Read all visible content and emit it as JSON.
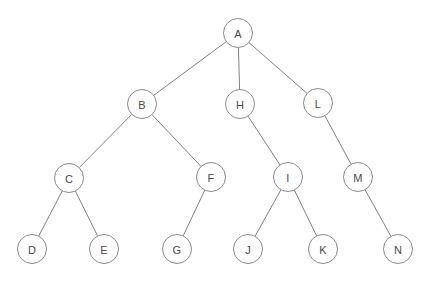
{
  "diagram": {
    "type": "tree",
    "canvas": {
      "width": 433,
      "height": 281,
      "background": "#ffffff"
    },
    "style": {
      "node_fill": "#ffffff",
      "node_stroke": "#8a8a8a",
      "node_radius": 14.5,
      "edge_stroke": "#808080",
      "edge_width": 1,
      "label_color": "#4a4a4a",
      "label_size": 11
    },
    "root": "A",
    "levels": [
      [
        "A"
      ],
      [
        "B",
        "H",
        "L"
      ],
      [
        "C",
        "F",
        "I",
        "M"
      ],
      [
        "D",
        "E",
        "G",
        "J",
        "K",
        "N"
      ]
    ],
    "nodes": [
      {
        "id": "A",
        "label": "A",
        "x": 238,
        "y": 33,
        "level": 0,
        "parent": null
      },
      {
        "id": "B",
        "label": "B",
        "x": 142,
        "y": 104,
        "level": 1,
        "parent": "A"
      },
      {
        "id": "H",
        "label": "H",
        "x": 240,
        "y": 104,
        "level": 1,
        "parent": "A"
      },
      {
        "id": "L",
        "label": "L",
        "x": 318,
        "y": 103,
        "level": 1,
        "parent": "A"
      },
      {
        "id": "C",
        "label": "C",
        "x": 69,
        "y": 178,
        "level": 2,
        "parent": "B"
      },
      {
        "id": "F",
        "label": "F",
        "x": 211,
        "y": 177,
        "level": 2,
        "parent": "B"
      },
      {
        "id": "I",
        "label": "I",
        "x": 288,
        "y": 177,
        "level": 2,
        "parent": "H"
      },
      {
        "id": "M",
        "label": "M",
        "x": 358,
        "y": 177,
        "level": 2,
        "parent": "L"
      },
      {
        "id": "D",
        "label": "D",
        "x": 32,
        "y": 249,
        "level": 3,
        "parent": "C"
      },
      {
        "id": "E",
        "label": "E",
        "x": 104,
        "y": 249,
        "level": 3,
        "parent": "C"
      },
      {
        "id": "G",
        "label": "G",
        "x": 177,
        "y": 249,
        "level": 3,
        "parent": "F"
      },
      {
        "id": "J",
        "label": "J",
        "x": 248,
        "y": 249,
        "level": 3,
        "parent": "I"
      },
      {
        "id": "K",
        "label": "K",
        "x": 323,
        "y": 249,
        "level": 3,
        "parent": "I"
      },
      {
        "id": "N",
        "label": "N",
        "x": 398,
        "y": 249,
        "level": 3,
        "parent": "M"
      }
    ],
    "edges": [
      {
        "from": "A",
        "to": "B"
      },
      {
        "from": "A",
        "to": "H"
      },
      {
        "from": "A",
        "to": "L"
      },
      {
        "from": "B",
        "to": "C"
      },
      {
        "from": "B",
        "to": "F"
      },
      {
        "from": "C",
        "to": "D"
      },
      {
        "from": "C",
        "to": "E"
      },
      {
        "from": "F",
        "to": "G"
      },
      {
        "from": "H",
        "to": "I"
      },
      {
        "from": "I",
        "to": "J"
      },
      {
        "from": "I",
        "to": "K"
      },
      {
        "from": "L",
        "to": "M"
      },
      {
        "from": "M",
        "to": "N"
      }
    ]
  }
}
